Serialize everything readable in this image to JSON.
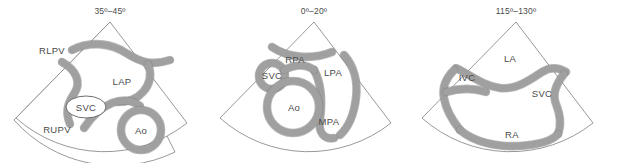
{
  "figure": {
    "type": "tee-sector-diagram-set",
    "background_color": "#ffffff",
    "vessel_wall_color": "#a0a0a0",
    "vessel_outline_color": "#7d7d7d",
    "sector_outline_color": "#8d8d8d",
    "label_color": "#4a4a4a"
  },
  "panels": [
    {
      "id": "panel-0",
      "title": "35º–45º",
      "labels": [
        {
          "text": "RLPV",
          "x": 52,
          "y": 54
        },
        {
          "text": "LAP",
          "x": 122,
          "y": 85
        },
        {
          "text": "SVC",
          "x": 86,
          "y": 110
        },
        {
          "text": "RUPV",
          "x": 57,
          "y": 133
        },
        {
          "text": "Ao",
          "x": 141,
          "y": 133
        }
      ]
    },
    {
      "id": "panel-1",
      "title": "0º–20º",
      "labels": [
        {
          "text": "RPA",
          "x": 87,
          "y": 60
        },
        {
          "text": "LPA",
          "x": 125,
          "y": 75
        },
        {
          "text": "SVC",
          "x": 62,
          "y": 79
        },
        {
          "text": "Ao",
          "x": 88,
          "y": 110
        },
        {
          "text": "MPA",
          "x": 119,
          "y": 125
        }
      ]
    },
    {
      "id": "panel-2",
      "title": "115º–130º",
      "labels": [
        {
          "text": "LA",
          "x": 94,
          "y": 61
        },
        {
          "text": "IVC",
          "x": 51,
          "y": 80
        },
        {
          "text": "SVC",
          "x": 126,
          "y": 96
        },
        {
          "text": "RA",
          "x": 96,
          "y": 137
        }
      ]
    }
  ]
}
